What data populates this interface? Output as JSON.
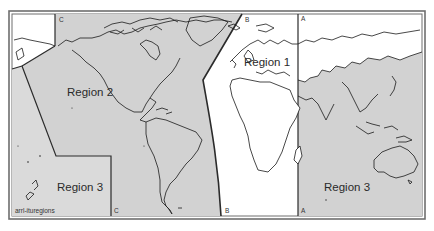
{
  "figure": {
    "credit": "arrl-ituregions",
    "colors": {
      "shaded_region": "#d2d2d2",
      "unshaded_region": "#ffffff",
      "frame": "#6e6e6e",
      "boundary": "#2b2b2b"
    }
  },
  "regions": [
    {
      "id": "region-1",
      "label": "Region 1",
      "shading": "white"
    },
    {
      "id": "region-2",
      "label": "Region 2",
      "shading": "gray"
    },
    {
      "id": "region-3-west",
      "label": "Region 3",
      "shading": "gray"
    },
    {
      "id": "region-3-east",
      "label": "Region 3",
      "shading": "gray"
    }
  ],
  "boundary_lines": [
    {
      "id": "line-a",
      "top_label": "A",
      "bottom_label": "A"
    },
    {
      "id": "line-b",
      "top_label": "B",
      "bottom_label": "B"
    },
    {
      "id": "line-c",
      "top_label": "C",
      "bottom_label": "C"
    }
  ]
}
